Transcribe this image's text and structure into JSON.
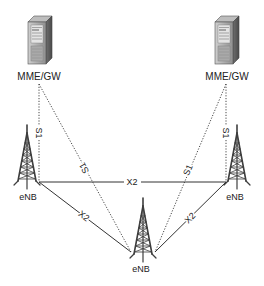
{
  "diagram": {
    "type": "network-architecture",
    "nodes": {
      "mme_left": {
        "label": "MME/GW",
        "icon": "server-icon"
      },
      "mme_right": {
        "label": "MME/GW",
        "icon": "server-icon"
      },
      "enb_left": {
        "label": "eNB",
        "icon": "cell-tower-icon"
      },
      "enb_right": {
        "label": "eNB",
        "icon": "cell-tower-icon"
      },
      "enb_center": {
        "label": "eNB",
        "icon": "cell-tower-icon"
      }
    },
    "links": {
      "s1_left_vertical": {
        "label": "S1",
        "style": "dotted",
        "from": "mme_left",
        "to": "enb_left"
      },
      "s1_left_diag": {
        "label": "S1",
        "style": "dotted",
        "from": "mme_left",
        "to": "enb_center"
      },
      "s1_right_vertical": {
        "label": "S1",
        "style": "dotted",
        "from": "mme_right",
        "to": "enb_right"
      },
      "s1_right_diag": {
        "label": "S1",
        "style": "dotted",
        "from": "mme_right",
        "to": "enb_center"
      },
      "x2_top": {
        "label": "X2",
        "style": "solid",
        "from": "enb_left",
        "to": "enb_right"
      },
      "x2_left": {
        "label": "X2",
        "style": "solid",
        "from": "enb_left",
        "to": "enb_center"
      },
      "x2_right": {
        "label": "X2",
        "style": "solid",
        "from": "enb_right",
        "to": "enb_center"
      }
    },
    "colors": {
      "line": "#333333",
      "server_body": "#9a9a9a",
      "tower": "#444444"
    }
  }
}
